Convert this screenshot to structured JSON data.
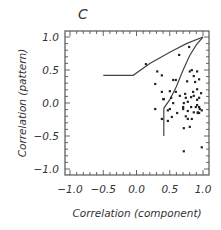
{
  "chart_data": {
    "type": "scatter",
    "panel_label": "C",
    "title": "",
    "xlabel": "Correlation (component)",
    "ylabel": "Correlation (pattern)",
    "xlim": [
      -1.0,
      1.0
    ],
    "ylim": [
      -1.0,
      1.0
    ],
    "xticks": [
      "-1.0",
      "-0.5",
      "0.0",
      "0.5",
      "1.0"
    ],
    "yticks": [
      "1.0",
      "0.5",
      "0.0",
      "-0.5",
      "-1.0"
    ],
    "xtick_values": [
      -1.0,
      -0.5,
      0.0,
      0.5,
      1.0
    ],
    "ytick_values": [
      1.0,
      0.5,
      0.0,
      -0.5,
      -1.0
    ],
    "grid": false,
    "legend": null,
    "boundary_lines": [
      {
        "name": "outer bound",
        "points": [
          [
            -0.5,
            0.42
          ],
          [
            -0.05,
            0.42
          ],
          [
            0.2,
            0.6
          ],
          [
            0.5,
            0.77
          ],
          [
            0.75,
            0.9
          ],
          [
            1.0,
            1.0
          ]
        ]
      },
      {
        "name": "inner bound",
        "points": [
          [
            0.41,
            -0.5
          ],
          [
            0.41,
            -0.08
          ],
          [
            0.5,
            0.05
          ],
          [
            0.6,
            0.25
          ],
          [
            0.7,
            0.5
          ],
          [
            0.8,
            0.72
          ],
          [
            0.9,
            0.88
          ],
          [
            1.0,
            1.0
          ]
        ]
      }
    ],
    "points": [
      [
        0.14,
        0.59
      ],
      [
        0.31,
        0.48
      ],
      [
        0.38,
        0.42
      ],
      [
        0.28,
        0.29
      ],
      [
        0.64,
        0.73
      ],
      [
        0.91,
        0.48
      ],
      [
        0.79,
        0.85
      ],
      [
        0.8,
        0.48
      ],
      [
        0.83,
        0.5
      ],
      [
        0.55,
        0.35
      ],
      [
        0.59,
        0.35
      ],
      [
        0.38,
        0.17
      ],
      [
        0.41,
        0.06
      ],
      [
        0.4,
        0.06
      ],
      [
        0.5,
        0.18
      ],
      [
        0.59,
        0.17
      ],
      [
        0.65,
        0.11
      ],
      [
        0.73,
        0.14
      ],
      [
        0.52,
        0.08
      ],
      [
        0.55,
        0.0
      ],
      [
        0.28,
        -0.09
      ],
      [
        0.5,
        -0.09
      ],
      [
        0.47,
        -0.11
      ],
      [
        0.53,
        -0.21
      ],
      [
        0.38,
        -0.24
      ],
      [
        0.47,
        -0.27
      ],
      [
        0.61,
        -0.15
      ],
      [
        0.7,
        -0.06
      ],
      [
        0.71,
        0.0
      ],
      [
        0.74,
        0.08
      ],
      [
        0.76,
        0.33
      ],
      [
        0.86,
        0.41
      ],
      [
        0.88,
        0.32
      ],
      [
        0.94,
        0.36
      ],
      [
        0.91,
        0.21
      ],
      [
        0.85,
        0.17
      ],
      [
        0.82,
        0.09
      ],
      [
        0.86,
        0.11
      ],
      [
        0.94,
        0.08
      ],
      [
        0.91,
        0.05
      ],
      [
        0.97,
        0.15
      ],
      [
        0.94,
        -0.06
      ],
      [
        0.95,
        -0.09
      ],
      [
        0.98,
        -0.11
      ],
      [
        0.92,
        -0.14
      ],
      [
        0.94,
        -0.15
      ],
      [
        0.92,
        -0.15
      ],
      [
        0.86,
        -0.14
      ],
      [
        0.82,
        -0.06
      ],
      [
        0.77,
        -0.12
      ],
      [
        0.74,
        -0.2
      ],
      [
        0.77,
        -0.24
      ],
      [
        0.83,
        -0.24
      ],
      [
        0.8,
        -0.36
      ],
      [
        0.71,
        -0.38
      ],
      [
        0.77,
        0.02
      ],
      [
        0.7,
        -0.09
      ],
      [
        0.91,
        -0.03
      ],
      [
        0.98,
        -0.67
      ],
      [
        0.71,
        -0.73
      ],
      [
        0.89,
        -0.06
      ]
    ]
  },
  "colors": {
    "axis": "#555555",
    "line": "#444444",
    "point": "#222222",
    "text": "#333333"
  }
}
